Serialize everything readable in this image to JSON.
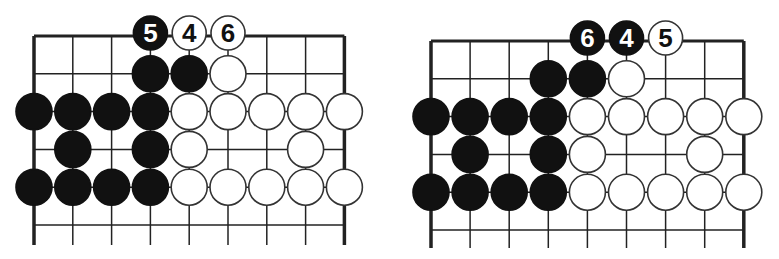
{
  "colors": {
    "line": "#222222",
    "black_stone": "#111111",
    "white_stone": "#ffffff",
    "stone_outline": "#333333",
    "background": "#ffffff"
  },
  "diagrams": [
    {
      "id": "left",
      "origin": [
        34,
        36
      ],
      "spacing": [
        38.8,
        37.8
      ],
      "cols": 9,
      "rows": 6,
      "line_bottom": 245,
      "stones": [
        {
          "c": 3,
          "r": 0,
          "color": "black",
          "label": "5"
        },
        {
          "c": 4,
          "r": 0,
          "color": "white",
          "label": "4"
        },
        {
          "c": 5,
          "r": 0,
          "color": "white",
          "label": "6"
        },
        {
          "c": 3,
          "r": 1,
          "color": "black"
        },
        {
          "c": 4,
          "r": 1,
          "color": "black"
        },
        {
          "c": 5,
          "r": 1,
          "color": "white"
        },
        {
          "c": 0,
          "r": 2,
          "color": "black"
        },
        {
          "c": 1,
          "r": 2,
          "color": "black"
        },
        {
          "c": 2,
          "r": 2,
          "color": "black"
        },
        {
          "c": 3,
          "r": 2,
          "color": "black"
        },
        {
          "c": 4,
          "r": 2,
          "color": "white"
        },
        {
          "c": 5,
          "r": 2,
          "color": "white"
        },
        {
          "c": 6,
          "r": 2,
          "color": "white"
        },
        {
          "c": 7,
          "r": 2,
          "color": "white"
        },
        {
          "c": 8,
          "r": 2,
          "color": "white"
        },
        {
          "c": 1,
          "r": 3,
          "color": "black"
        },
        {
          "c": 3,
          "r": 3,
          "color": "black"
        },
        {
          "c": 4,
          "r": 3,
          "color": "white"
        },
        {
          "c": 7,
          "r": 3,
          "color": "white"
        },
        {
          "c": 0,
          "r": 4,
          "color": "black"
        },
        {
          "c": 1,
          "r": 4,
          "color": "black"
        },
        {
          "c": 2,
          "r": 4,
          "color": "black"
        },
        {
          "c": 3,
          "r": 4,
          "color": "black"
        },
        {
          "c": 4,
          "r": 4,
          "color": "white"
        },
        {
          "c": 5,
          "r": 4,
          "color": "white"
        },
        {
          "c": 6,
          "r": 4,
          "color": "white"
        },
        {
          "c": 7,
          "r": 4,
          "color": "white"
        },
        {
          "c": 8,
          "r": 4,
          "color": "white"
        }
      ]
    },
    {
      "id": "right",
      "origin": [
        431,
        41
      ],
      "spacing": [
        39.1,
        37.8
      ],
      "cols": 9,
      "rows": 6,
      "line_bottom": 248,
      "stones": [
        {
          "c": 4,
          "r": 0,
          "color": "black",
          "label": "6"
        },
        {
          "c": 5,
          "r": 0,
          "color": "black",
          "label": "4"
        },
        {
          "c": 6,
          "r": 0,
          "color": "white",
          "label": "5"
        },
        {
          "c": 3,
          "r": 1,
          "color": "black"
        },
        {
          "c": 4,
          "r": 1,
          "color": "black"
        },
        {
          "c": 5,
          "r": 1,
          "color": "white"
        },
        {
          "c": 0,
          "r": 2,
          "color": "black"
        },
        {
          "c": 1,
          "r": 2,
          "color": "black"
        },
        {
          "c": 2,
          "r": 2,
          "color": "black"
        },
        {
          "c": 3,
          "r": 2,
          "color": "black"
        },
        {
          "c": 4,
          "r": 2,
          "color": "white"
        },
        {
          "c": 5,
          "r": 2,
          "color": "white"
        },
        {
          "c": 6,
          "r": 2,
          "color": "white"
        },
        {
          "c": 7,
          "r": 2,
          "color": "white"
        },
        {
          "c": 8,
          "r": 2,
          "color": "white"
        },
        {
          "c": 1,
          "r": 3,
          "color": "black"
        },
        {
          "c": 3,
          "r": 3,
          "color": "black"
        },
        {
          "c": 4,
          "r": 3,
          "color": "white"
        },
        {
          "c": 7,
          "r": 3,
          "color": "white"
        },
        {
          "c": 0,
          "r": 4,
          "color": "black"
        },
        {
          "c": 1,
          "r": 4,
          "color": "black"
        },
        {
          "c": 2,
          "r": 4,
          "color": "black"
        },
        {
          "c": 3,
          "r": 4,
          "color": "black"
        },
        {
          "c": 4,
          "r": 4,
          "color": "white"
        },
        {
          "c": 5,
          "r": 4,
          "color": "white"
        },
        {
          "c": 6,
          "r": 4,
          "color": "white"
        },
        {
          "c": 7,
          "r": 4,
          "color": "white"
        },
        {
          "c": 8,
          "r": 4,
          "color": "white"
        }
      ]
    }
  ]
}
